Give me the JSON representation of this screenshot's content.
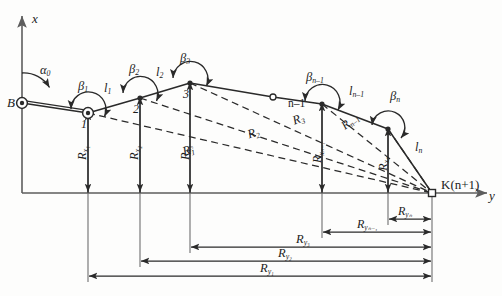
{
  "figure": {
    "type": "geometry-diagram"
  },
  "axes": {
    "vertical_label": "x",
    "horizontal_label": "y",
    "origin_label": "B",
    "initial_bearing_label": "α",
    "initial_bearing_sub": "0"
  },
  "stations": [
    {
      "id": "B",
      "label": "B",
      "x": 22,
      "y": 103,
      "marker": "double-circle"
    },
    {
      "id": "1",
      "label": "1",
      "x": 88,
      "y": 113,
      "marker": "double-circle"
    },
    {
      "id": "2",
      "label": "2",
      "x": 140,
      "y": 98,
      "marker": "dot"
    },
    {
      "id": "3",
      "label": "3",
      "x": 190,
      "y": 83,
      "marker": "dot"
    },
    {
      "id": "mid",
      "label": "",
      "x": 273,
      "y": 97,
      "marker": "open-circle"
    },
    {
      "id": "n-1",
      "label": "n–1",
      "x": 322,
      "y": 104,
      "marker": "dot"
    },
    {
      "id": "n",
      "label": "",
      "x": 388,
      "y": 129,
      "marker": "dot"
    },
    {
      "id": "K",
      "label": "K(n+1)",
      "x": 432,
      "y": 193,
      "marker": "open-square"
    }
  ],
  "angles": [
    {
      "name": "alpha-0",
      "base": "α",
      "sub": "0",
      "x": 43,
      "y": 72
    },
    {
      "name": "beta-1",
      "base": "β",
      "sub": "1",
      "x": 81,
      "y": 88
    },
    {
      "name": "beta-2",
      "base": "β",
      "sub": "2",
      "x": 132,
      "y": 70
    },
    {
      "name": "beta-3",
      "base": "β",
      "sub": "3",
      "x": 183,
      "y": 59
    },
    {
      "name": "beta-n-1",
      "base": "β",
      "sub": "n–1",
      "x": 310,
      "y": 78
    },
    {
      "name": "beta-n",
      "base": "β",
      "sub": "n",
      "x": 393,
      "y": 97
    }
  ],
  "sides": [
    {
      "name": "l-1",
      "base": "l",
      "sub": "1",
      "x": 107,
      "y": 88
    },
    {
      "name": "l-2",
      "base": "l",
      "sub": "2",
      "x": 159,
      "y": 72
    },
    {
      "name": "l-n-1",
      "base": "l",
      "sub": "n–1",
      "x": 352,
      "y": 92
    },
    {
      "name": "l-n",
      "base": "l",
      "sub": "n",
      "x": 417,
      "y": 148
    }
  ],
  "radials": [
    {
      "name": "R-1",
      "base": "R",
      "sub": "1",
      "x": 190,
      "y": 151,
      "rot": -17
    },
    {
      "name": "R-2",
      "base": "R",
      "sub": "2",
      "x": 254,
      "y": 134,
      "rot": -17
    },
    {
      "name": "R-3",
      "base": "R",
      "sub": "3",
      "x": 298,
      "y": 120,
      "rot": -20
    },
    {
      "name": "R-n-1",
      "base": "R",
      "sub": "n–1",
      "x": 348,
      "y": 122,
      "rot": -38
    }
  ],
  "x_increments": [
    {
      "name": "Rx-1",
      "base": "R",
      "sub": "x₁",
      "x": 82,
      "y": 152
    },
    {
      "name": "Rx-2",
      "base": "R",
      "sub": "x₂",
      "x": 134,
      "y": 152
    },
    {
      "name": "Rx-3",
      "base": "R",
      "sub": "x₃",
      "x": 185,
      "y": 152
    },
    {
      "name": "Rx-n-1",
      "base": "R",
      "sub": "xₙ₋₁",
      "x": 317,
      "y": 152
    },
    {
      "name": "Rx-n",
      "base": "R",
      "sub": "xₙ",
      "x": 383,
      "y": 160
    }
  ],
  "y_increments": [
    {
      "name": "Ry-n",
      "base": "R",
      "sub": "yₙ",
      "x": 401,
      "y": 215,
      "from": 388,
      "to": 432,
      "line_y": 219
    },
    {
      "name": "Ry-n-1",
      "base": "R",
      "sub": "yₙ₋₁",
      "x": 367,
      "y": 225,
      "from": 322,
      "to": 432,
      "line_y": 232
    },
    {
      "name": "Ry-3",
      "base": "R",
      "sub": "y₃",
      "x": 300,
      "y": 240,
      "from": 190,
      "to": 432,
      "line_y": 247
    },
    {
      "name": "Ry-2",
      "base": "R",
      "sub": "y₂",
      "x": 284,
      "y": 254,
      "from": 140,
      "to": 432,
      "line_y": 261
    },
    {
      "name": "Ry-1",
      "base": "R",
      "sub": "y₁",
      "x": 266,
      "y": 269,
      "from": 88,
      "to": 432,
      "line_y": 276
    }
  ],
  "colors": {
    "stroke": "#2a2a2a",
    "axis": "#6e6e6e",
    "background": "#fdfdfc",
    "text": "#1b1b1b"
  }
}
